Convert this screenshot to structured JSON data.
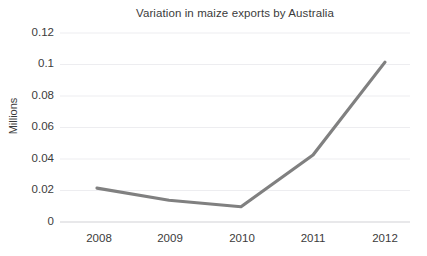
{
  "chart_data": {
    "type": "line",
    "title": "Variation in maize exports by Australia",
    "xlabel": "",
    "ylabel": "Millions",
    "categories": [
      "2008",
      "2009",
      "2010",
      "2011",
      "2012"
    ],
    "x": [
      2008,
      2009,
      2010,
      2011,
      2012
    ],
    "values": [
      0.0215,
      0.0138,
      0.0097,
      0.0425,
      0.1015
    ],
    "series": [
      {
        "name": "Maize exports",
        "values": [
          0.0215,
          0.0138,
          0.0097,
          0.0425,
          0.1015
        ]
      }
    ],
    "ylim": [
      0,
      0.12
    ],
    "y_ticks": [
      0,
      0.02,
      0.04,
      0.06,
      0.08,
      0.1,
      0.12
    ],
    "y_tick_labels": [
      "0",
      "0.02",
      "0.04",
      "0.06",
      "0.08",
      "0.1",
      "0.12"
    ],
    "grid": "horizontal",
    "legend": "none",
    "line_color": "#808080",
    "grid_color": "#ededf0",
    "axis_color": "#e3e3e6",
    "background_color": "#ffffff",
    "text_color": "#3b3b3b"
  }
}
